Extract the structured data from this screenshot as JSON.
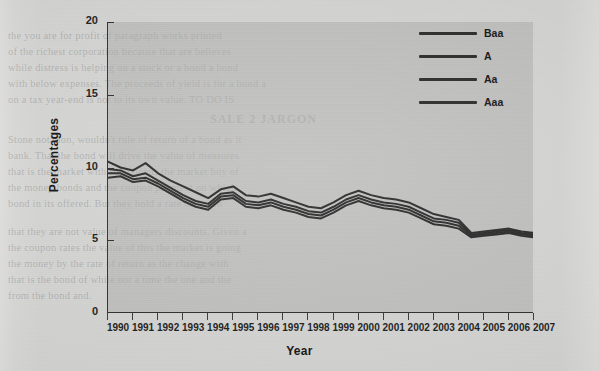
{
  "figure": {
    "background_color": "#d7d7d5",
    "panel_color": "#b0b0ae",
    "line_color": "#2b2b2b",
    "axis_color": "#2e2e2e"
  },
  "legend": {
    "position": "top-right",
    "entries": [
      {
        "label": "Baa",
        "color": "#2b2b2b"
      },
      {
        "label": "A",
        "color": "#2b2b2b"
      },
      {
        "label": "Aa",
        "color": "#2b2b2b"
      },
      {
        "label": "Aaa",
        "color": "#2b2b2b"
      }
    ]
  },
  "page_bleed": {
    "l1": "the you are for profit of paragraph works printed",
    "l2": "of the richest corporation because that are believes",
    "l3": "while distress is helping on a stock or a bond a bond",
    "l4": "with below expenses. The proceeds of yield is for a bond a",
    "l5": "on a tax year-end is not to its own value. TO DO IS",
    "h1": "SALE 2 JARGON",
    "m1": "Stone notation, wouldn't rule of return of a bond as it",
    "m2": "bank. That the bond will drive the value of measures",
    "m3": "that is the market with such bonds the market buy of",
    "m4": "the money bonds and the coupon payment on which",
    "m5": "bond in its offered. But they hold a rate of return",
    "m6": "that they are not value of managers discounts. Given a",
    "m7": "the coupon rates the value of this the market is going",
    "m8": "the money by the rate of return as the change with",
    "m9": "that is the bond of while not a time the one and the",
    "m10": "from the bond and."
  },
  "chart_data": {
    "type": "line",
    "title": "",
    "xlabel": "Year",
    "ylabel": "Percentages",
    "xlim": [
      1990,
      2007
    ],
    "ylim": [
      0,
      20
    ],
    "yticks": [
      0,
      5,
      10,
      15,
      20
    ],
    "grid": false,
    "legend_position": "top-right",
    "x": [
      1990,
      1990.5,
      1991,
      1991.5,
      1992,
      1992.5,
      1993,
      1993.5,
      1994,
      1994.5,
      1995,
      1995.5,
      1996,
      1996.5,
      1997,
      1997.5,
      1998,
      1998.5,
      1999,
      1999.5,
      2000,
      2000.5,
      2001,
      2001.5,
      2002,
      2002.5,
      2003,
      2003.5,
      2004,
      2004.5,
      2005,
      2005.5,
      2006,
      2006.5,
      2007
    ],
    "series": [
      {
        "name": "Baa",
        "color": "#2b2b2b",
        "values": [
          10.4,
          10.0,
          9.8,
          10.3,
          9.6,
          9.1,
          8.7,
          8.3,
          7.9,
          8.5,
          8.7,
          8.1,
          8.0,
          8.2,
          7.9,
          7.6,
          7.3,
          7.2,
          7.6,
          8.1,
          8.4,
          8.1,
          7.9,
          7.8,
          7.6,
          7.2,
          6.8,
          6.6,
          6.4,
          5.5,
          5.6,
          5.7,
          5.8,
          5.6,
          5.5
        ]
      },
      {
        "name": "A",
        "color": "#2b2b2b",
        "values": [
          9.9,
          9.8,
          9.4,
          9.6,
          9.1,
          8.6,
          8.1,
          7.7,
          7.5,
          8.2,
          8.3,
          7.7,
          7.6,
          7.8,
          7.5,
          7.3,
          7.0,
          6.9,
          7.3,
          7.8,
          8.1,
          7.8,
          7.6,
          7.5,
          7.3,
          6.9,
          6.5,
          6.4,
          6.2,
          5.4,
          5.5,
          5.6,
          5.7,
          5.5,
          5.4
        ]
      },
      {
        "name": "Aa",
        "color": "#2b2b2b",
        "values": [
          9.6,
          9.6,
          9.2,
          9.3,
          8.9,
          8.4,
          7.9,
          7.5,
          7.3,
          8.0,
          8.1,
          7.5,
          7.4,
          7.6,
          7.3,
          7.1,
          6.8,
          6.7,
          7.1,
          7.6,
          7.9,
          7.6,
          7.4,
          7.3,
          7.1,
          6.7,
          6.3,
          6.2,
          6.0,
          5.3,
          5.4,
          5.5,
          5.6,
          5.4,
          5.3
        ]
      },
      {
        "name": "Aaa",
        "color": "#2b2b2b",
        "values": [
          9.3,
          9.4,
          9.0,
          9.1,
          8.7,
          8.2,
          7.7,
          7.3,
          7.1,
          7.8,
          7.9,
          7.3,
          7.2,
          7.4,
          7.1,
          6.9,
          6.6,
          6.5,
          6.9,
          7.4,
          7.7,
          7.4,
          7.2,
          7.1,
          6.9,
          6.5,
          6.1,
          6.0,
          5.8,
          5.2,
          5.3,
          5.4,
          5.5,
          5.3,
          5.2
        ]
      }
    ]
  }
}
